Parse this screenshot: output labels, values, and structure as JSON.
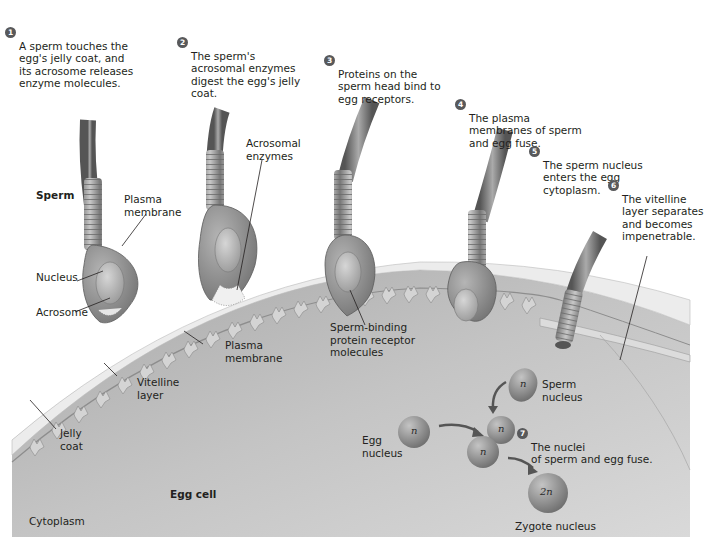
{
  "steps": [
    {
      "number": "1",
      "text": "A sperm touches the\negg's jelly coat, and\nits acrosome releases\nenzyme molecules."
    },
    {
      "number": "2",
      "text": "The sperm's\nacrosomal enzymes\ndigest the egg's jelly\ncoat."
    },
    {
      "number": "3",
      "text": "Proteins on the\nsperm head bind to\negg receptors."
    },
    {
      "number": "4",
      "text": "The plasma\nmembranes of sperm\nand egg fuse."
    },
    {
      "number": "5",
      "text": "The sperm nucleus\nenters the egg\ncytoplasm."
    },
    {
      "number": "6",
      "text": "The vitelline\nlayer separates\nand becomes\nimpenetrable."
    },
    {
      "number": "7",
      "text": "The nuclei\nof sperm and egg fuse."
    }
  ],
  "labels": {
    "sperm": "Sperm",
    "plasma_membrane_sperm": "Plasma\nmembrane",
    "nucleus": "Nucleus",
    "acrosome": "Acrosome",
    "acrosomal_enzymes": "Acrosomal\nenzymes",
    "receptor_molecules": "Sperm-binding\nprotein receptor\nmolecules",
    "plasma_membrane_egg": "Plasma\nmembrane",
    "vitelline_layer": "Vitelline\nlayer",
    "jelly_coat": "Jelly\ncoat",
    "egg_cell": "Egg cell",
    "cytoplasm": "Cytoplasm",
    "sperm_nucleus": "Sperm\nnucleus",
    "egg_nucleus": "Egg\nnucleus",
    "zygote_nucleus": "Zygote nucleus"
  },
  "ploidy": {
    "sperm": "n",
    "egg": "n",
    "fusing_a": "n",
    "fusing_b": "n",
    "zygote": "2n"
  },
  "colors": {
    "cytoplasm": "#bdbdbd",
    "jelly_coat": "#eeeeee",
    "sperm_body": "#8c8c8c",
    "badge": "#58595b"
  }
}
